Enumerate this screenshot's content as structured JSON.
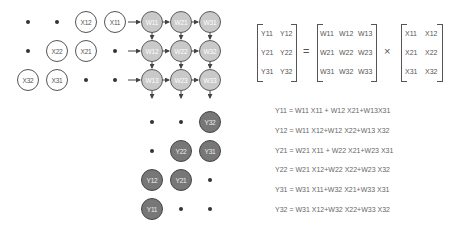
{
  "x_array": {
    "nodes": [
      {
        "label": "X12",
        "x": 86,
        "y": 22
      },
      {
        "label": "X11",
        "x": 115,
        "y": 22
      },
      {
        "label": "X22",
        "x": 57,
        "y": 51
      },
      {
        "label": "X21",
        "x": 86,
        "y": 51
      },
      {
        "label": "X32",
        "x": 28,
        "y": 80
      },
      {
        "label": "X31",
        "x": 57,
        "y": 80
      }
    ],
    "dots": [
      [
        28,
        22
      ],
      [
        57,
        22
      ],
      [
        28,
        51
      ],
      [
        115,
        51
      ],
      [
        86,
        80
      ],
      [
        115,
        80
      ]
    ]
  },
  "w_array": {
    "rows": [
      [
        "W11",
        "W21",
        "W31"
      ],
      [
        "W12",
        "W22",
        "W32"
      ],
      [
        "W13",
        "W23",
        "W33"
      ]
    ]
  },
  "y_array": {
    "nodes": [
      {
        "label": "Y32",
        "x": 210,
        "y": 122
      },
      {
        "label": "Y22",
        "x": 181,
        "y": 151
      },
      {
        "label": "Y31",
        "x": 210,
        "y": 151
      },
      {
        "label": "Y12",
        "x": 152,
        "y": 180
      },
      {
        "label": "Y21",
        "x": 181,
        "y": 180
      },
      {
        "label": "Y11",
        "x": 152,
        "y": 209
      }
    ],
    "dots": [
      [
        152,
        122
      ],
      [
        181,
        122
      ],
      [
        152,
        151
      ],
      [
        210,
        180
      ],
      [
        181,
        209
      ],
      [
        210,
        209
      ]
    ]
  },
  "matrix_equation": {
    "Y": [
      [
        "Y11",
        "Y12"
      ],
      [
        "Y21",
        "Y22"
      ],
      [
        "Y31",
        "Y32"
      ]
    ],
    "equals": "=",
    "W": [
      [
        "W11",
        "W12",
        "W13"
      ],
      [
        "W21",
        "W22",
        "W23"
      ],
      [
        "W31",
        "W32",
        "W33"
      ]
    ],
    "times": "×",
    "X": [
      [
        "X11",
        "X12"
      ],
      [
        "X21",
        "X22"
      ],
      [
        "X31",
        "X32"
      ]
    ]
  },
  "equations": [
    "Y11 = W11 X11 + W12 X21+W13X31",
    "Y12 = W11 X12+W12 X22+W13 X32",
    "Y21 = W21 X11 + W22 X21+W23 X31",
    "Y22 = W21 X12+W22 X22+W23 X32",
    "Y31 = W31 X11+W32 X21+W33 X31",
    "Y32 = W31 X12+W32 X22+W33 X32"
  ]
}
